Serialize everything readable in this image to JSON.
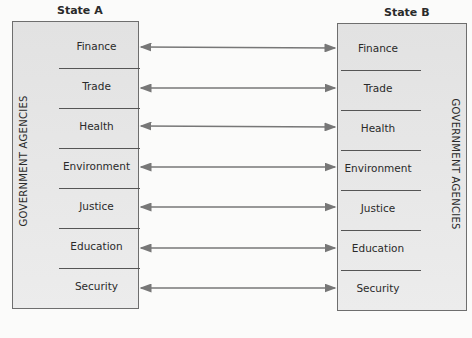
{
  "state_a": {
    "title": "State A",
    "side_label": "GOVERNMENT AGENCIES"
  },
  "state_b": {
    "title": "State B",
    "side_label": "GOVERNMENT AGENCIES"
  },
  "agencies": [
    "Finance",
    "Trade",
    "Health",
    "Environment",
    "Justice",
    "Education",
    "Security"
  ],
  "colors": {
    "box_fill": "#e6e6e6",
    "arrow": "#777777",
    "border": "#6e6e6e"
  }
}
